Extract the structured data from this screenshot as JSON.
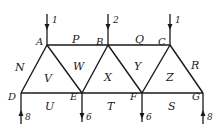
{
  "diagram": {
    "type": "truss-force-diagram",
    "nodes": {
      "A": {
        "label": "A",
        "x": 47,
        "y": 45
      },
      "B": {
        "label": "B",
        "x": 108,
        "y": 45
      },
      "C": {
        "label": "C",
        "x": 170,
        "y": 45
      },
      "D": {
        "label": "D",
        "x": 21,
        "y": 93
      },
      "E": {
        "label": "E",
        "x": 82,
        "y": 93
      },
      "F": {
        "label": "F",
        "x": 142,
        "y": 93
      },
      "G": {
        "label": "G",
        "x": 203,
        "y": 93
      }
    },
    "members": [
      [
        "A",
        "B"
      ],
      [
        "B",
        "C"
      ],
      [
        "D",
        "E"
      ],
      [
        "E",
        "F"
      ],
      [
        "F",
        "G"
      ],
      [
        "D",
        "A"
      ],
      [
        "A",
        "E"
      ],
      [
        "E",
        "B"
      ],
      [
        "B",
        "F"
      ],
      [
        "F",
        "C"
      ],
      [
        "C",
        "G"
      ]
    ],
    "space_labels": {
      "P": "P",
      "Q": "Q",
      "R": "R",
      "S": "S",
      "T": "T",
      "U": "U",
      "N": "N",
      "V": "V",
      "W": "W",
      "X": "X",
      "Y": "Y",
      "Z": "Z"
    },
    "forces": [
      {
        "node": "A",
        "direction": "down",
        "value": "1"
      },
      {
        "node": "B",
        "direction": "down",
        "value": "2"
      },
      {
        "node": "C",
        "direction": "down",
        "value": "1"
      },
      {
        "node": "D",
        "direction": "up",
        "value": "8"
      },
      {
        "node": "E",
        "direction": "down",
        "value": "6"
      },
      {
        "node": "F",
        "direction": "down",
        "value": "6"
      },
      {
        "node": "G",
        "direction": "up",
        "value": "8"
      }
    ]
  }
}
